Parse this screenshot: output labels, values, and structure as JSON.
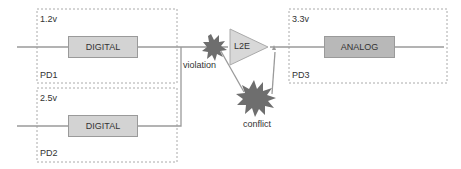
{
  "domains": [
    {
      "id": "PD1",
      "label": "PD1",
      "voltage": "1.2v",
      "block": "DIGITAL"
    },
    {
      "id": "PD2",
      "label": "PD2",
      "voltage": "2.5v",
      "block": "DIGITAL"
    },
    {
      "id": "PD3",
      "label": "PD3",
      "voltage": "3.3v",
      "block": "ANALOG"
    }
  ],
  "level_shifter": {
    "label": "L2E"
  },
  "annotations": {
    "violation": "violation",
    "conflict": "conflict"
  },
  "colors": {
    "line": "#9a9a9a",
    "star": "#6e6e6e",
    "block": "#d3d3d3",
    "analog_block": "#b8b8b8",
    "border": "#aaaaaa"
  }
}
